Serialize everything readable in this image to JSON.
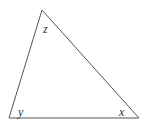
{
  "diagram": {
    "type": "triangle",
    "stroke_color": "#555555",
    "vertices": {
      "top": [
        42,
        10
      ],
      "bottom_left": [
        9,
        118
      ],
      "bottom_right": [
        139,
        118
      ]
    },
    "angle_labels": {
      "top": "z",
      "bottom_left": "y",
      "bottom_right": "x"
    }
  }
}
